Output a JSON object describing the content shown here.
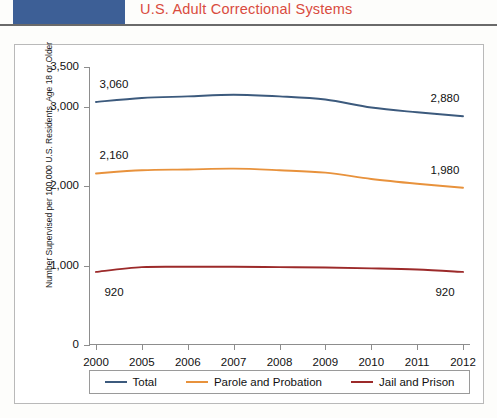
{
  "header": {
    "block_color": "#3d5f96",
    "title": "U.S. Adult Correctional Systems",
    "title_color": "#d94b3e"
  },
  "figure": {
    "ylabel": "Number Supervised per 100,000 U.S. Residents, Age 18 or Older"
  },
  "chart_data": {
    "type": "line",
    "title": "U.S. Adult Correctional Systems",
    "xlabel": "",
    "ylabel": "Number Supervised per 100,000 U.S. Residents, Age 18 or Older",
    "categories": [
      "2000",
      "2005",
      "2006",
      "2007",
      "2008",
      "2009",
      "2010",
      "2011",
      "2012"
    ],
    "ylim": [
      0,
      3500
    ],
    "yticks": [
      0,
      1000,
      2000,
      3000,
      3500
    ],
    "ytick_labels": [
      "0",
      "1,000",
      "2,000",
      "3,000",
      "3,500"
    ],
    "grid": false,
    "legend_position": "bottom",
    "series": [
      {
        "name": "Total",
        "color": "#3c5a7d",
        "values": [
          3060,
          3110,
          3130,
          3150,
          3130,
          3090,
          2990,
          2930,
          2880
        ],
        "point_labels": [
          {
            "category": "2000",
            "value": 3060,
            "text": "3,060"
          },
          {
            "category": "2012",
            "value": 2880,
            "text": "2,880"
          }
        ]
      },
      {
        "name": "Parole and Probation",
        "color": "#e8923c",
        "values": [
          2160,
          2200,
          2210,
          2220,
          2200,
          2170,
          2090,
          2030,
          1980
        ],
        "point_labels": [
          {
            "category": "2000",
            "value": 2160,
            "text": "2,160"
          },
          {
            "category": "2012",
            "value": 1980,
            "text": "1,980"
          }
        ]
      },
      {
        "name": "Jail and Prison",
        "color": "#9c2a2a",
        "values": [
          920,
          980,
          985,
          985,
          980,
          975,
          965,
          950,
          920
        ],
        "point_labels": [
          {
            "category": "2000",
            "value": 920,
            "text": "920"
          },
          {
            "category": "2012",
            "value": 920,
            "text": "920"
          }
        ]
      }
    ]
  }
}
